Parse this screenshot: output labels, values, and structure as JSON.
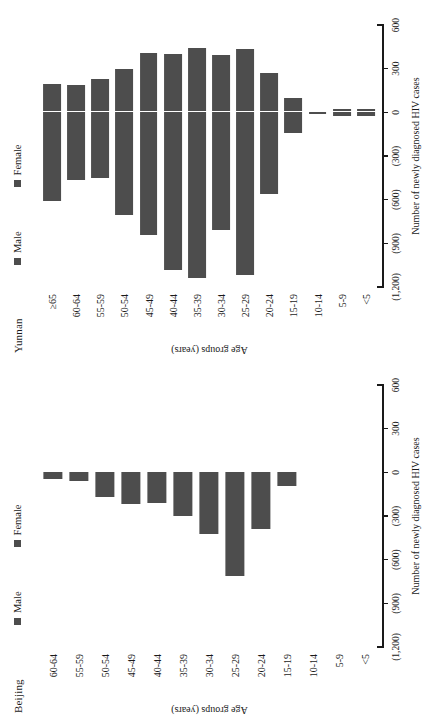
{
  "figure": {
    "background": "#ffffff",
    "bar_color": "#4d4d4d",
    "axis_color": "#1a1a1a"
  },
  "axis": {
    "x_title": "Number of newly diagnosed HIV cases",
    "y_title": "Age groups (years)",
    "x_ticks": [
      "(1,200)",
      "(900)",
      "(600)",
      "(300)",
      "0",
      "300",
      "600"
    ],
    "x_tick_values": [
      -1200,
      -900,
      -600,
      -300,
      0,
      300,
      600
    ],
    "x_min": -1200,
    "x_max": 600
  },
  "legend": {
    "male_label": "Male",
    "female_label": "Female",
    "male_color": "#4d4d4d",
    "female_color": "#4d4d4d"
  },
  "panels": [
    {
      "id": "beijing",
      "title": "Beijing"
    },
    {
      "id": "yunnan",
      "title": "Yunnan"
    }
  ],
  "chart_data": [
    {
      "type": "bar",
      "title": "Beijing",
      "xlabel": "Number of newly diagnosed HIV cases",
      "ylabel": "Age groups (years)",
      "xlim": [
        -1200,
        600
      ],
      "grid": false,
      "legend_position": "top",
      "orientation": "horizontal-pyramid",
      "categories": [
        "60-64",
        "55-59",
        "50-54",
        "45-49",
        "40-44",
        "35-39",
        "30-34",
        "25-29",
        "20-24",
        "15-19",
        "10-14",
        "5-9",
        "<5"
      ],
      "series": [
        {
          "name": "Male",
          "values": [
            -46,
            -62,
            -168,
            -218,
            -208,
            -300,
            -422,
            -714,
            -388,
            -96,
            0,
            0,
            0
          ]
        },
        {
          "name": "Female",
          "values": [
            4,
            4,
            8,
            8,
            8,
            10,
            10,
            12,
            6,
            2,
            0,
            0,
            0
          ]
        }
      ]
    },
    {
      "type": "bar",
      "title": "Yunnan",
      "xlabel": "Number of newly diagnosed HIV cases",
      "ylabel": "Age groups (years)",
      "xlim": [
        -1200,
        600
      ],
      "grid": false,
      "legend_position": "top",
      "orientation": "horizontal-pyramid",
      "categories": [
        "≥65",
        "60-64",
        "55-59",
        "50-54",
        "45-49",
        "40-44",
        "35-39",
        "30-34",
        "25-29",
        "20-24",
        "15-19",
        "10-14",
        "5-9",
        "<5"
      ],
      "series": [
        {
          "name": "Male",
          "values": [
            -612,
            -468,
            -450,
            -708,
            -840,
            -1080,
            -1140,
            -810,
            -1120,
            -560,
            -142,
            -14,
            -22,
            -22
          ]
        },
        {
          "name": "Female",
          "values": [
            196,
            188,
            228,
            300,
            410,
            402,
            444,
            392,
            432,
            268,
            100,
            12,
            20,
            20
          ]
        }
      ]
    }
  ]
}
